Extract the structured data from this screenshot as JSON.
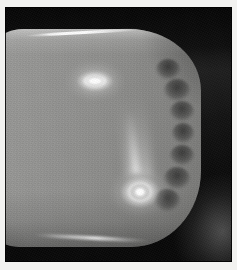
{
  "image": {
    "kind": "grayscale-scientific-photograph",
    "title": "Luminous rounded body with two emission spots",
    "description": "Black-and-white photographic plate showing a bright rounded-rectangular body filling the frame against a dark background. Two bright white emission spots are visible on the body, the lower one showing concentric ring structure with a faint vertical plume rising from it. The right flank of the body shows a series of dark scalloped lobes.",
    "width": 237,
    "height": 270,
    "colorspace": "grayscale",
    "border": {
      "paper_margin_color": "#f2f2f0",
      "plate_rule_color": "#0a0a0a",
      "margin_px": 5
    }
  },
  "palette": {
    "paper_white": "#f2f2f0",
    "background_black": "#090909",
    "background_dark_gray": "#2a2a2a",
    "body_light_gray": "#9b9b99",
    "body_mid_gray": "#8c8c8a",
    "body_dark_gray": "#767674",
    "highlight_white": "#ffffff",
    "haze_gray": "#969696"
  },
  "features": {
    "body": {
      "label": "luminous-body",
      "shape": "rounded-rectangle",
      "bbox": {
        "x": -26,
        "y": 22,
        "w": 222,
        "h": 218
      },
      "notes": "Brightest along the upper rim, darkening toward the lower edge and toward the right flank."
    },
    "rim_highlights": [
      {
        "label": "top-rim-specular-streak",
        "x": 20,
        "y": 24,
        "w": 118,
        "h": 3,
        "rotate_deg": -3.2
      },
      {
        "label": "bottom-rim-specular-streak",
        "x": 28,
        "y": 229,
        "w": 118,
        "h": 4,
        "rotate_deg": 3.0
      }
    ],
    "spots": [
      {
        "id": "spot-upper",
        "label": "upper-emission-spot",
        "center": {
          "x": 90,
          "y": 74
        },
        "size": {
          "w": 38,
          "h": 21
        },
        "shape": "elongated-lozenge",
        "peak_brightness": "saturated-white",
        "ring_structure": "single faint ring"
      },
      {
        "id": "spot-lower",
        "label": "lower-emission-spot",
        "center": {
          "x": 135,
          "y": 185
        },
        "size": {
          "w": 40,
          "h": 32
        },
        "shape": "concentric-bullseye",
        "peak_brightness": "saturated-white",
        "ring_structure": "bright core, inner dark annulus, bright outer ring, soft halo"
      }
    ],
    "plume": {
      "label": "vertical-plume",
      "from_spot": "spot-lower",
      "direction": "upward",
      "x": 118,
      "y": 92,
      "w": 26,
      "h": 78,
      "intensity": "faint-diffuse"
    },
    "edge_lobes": {
      "label": "right-flank-scalloped-lobes",
      "count": 7,
      "description": "Dark finger-like protrusions indenting the bright body along its right edge.",
      "items": [
        {
          "x": 150,
          "y": 52,
          "w": 26,
          "h": 22
        },
        {
          "x": 158,
          "y": 72,
          "w": 28,
          "h": 24
        },
        {
          "x": 164,
          "y": 94,
          "w": 26,
          "h": 22
        },
        {
          "x": 166,
          "y": 116,
          "w": 24,
          "h": 22
        },
        {
          "x": 164,
          "y": 138,
          "w": 26,
          "h": 22
        },
        {
          "x": 158,
          "y": 160,
          "w": 28,
          "h": 24
        },
        {
          "x": 148,
          "y": 182,
          "w": 28,
          "h": 24
        }
      ]
    },
    "background_regions": [
      {
        "label": "top-dark-band",
        "x": 0,
        "y": 0,
        "w": 227,
        "h": 64
      },
      {
        "label": "right-dark-field",
        "x": 150,
        "y": 0,
        "w": 77,
        "h": 255
      },
      {
        "label": "bottom-dark-band",
        "x": 0,
        "y": 232,
        "w": 227,
        "h": 23
      },
      {
        "label": "lower-right-haze",
        "x": 135,
        "y": 147,
        "w": 92,
        "h": 108
      }
    ]
  }
}
